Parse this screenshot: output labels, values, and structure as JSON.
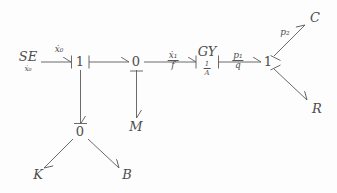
{
  "diagram": {
    "type": "bond-graph",
    "title": "",
    "background_color": "#fdfdfd",
    "line_color": "#5a5a5a",
    "text_color": "#4d4d4d",
    "nodes": [
      {
        "id": "se",
        "label": "SE",
        "sublabel": "ẋ₀",
        "kind": "source",
        "x": 28,
        "y": 62
      },
      {
        "id": "j1_left",
        "label": "1",
        "sublabel": "",
        "kind": "junction",
        "x": 80,
        "y": 61
      },
      {
        "id": "j0_mid",
        "label": "0",
        "sublabel": "",
        "kind": "junction",
        "x": 136,
        "y": 61
      },
      {
        "id": "gy",
        "label": "GY",
        "sublabel": "1/A",
        "kind": "gyrator",
        "x": 207,
        "y": 61
      },
      {
        "id": "j1_right",
        "label": "1",
        "sublabel": "",
        "kind": "junction",
        "x": 268,
        "y": 61
      },
      {
        "id": "j0_low",
        "label": "0",
        "sublabel": "",
        "kind": "junction",
        "x": 80,
        "y": 131
      },
      {
        "id": "m",
        "label": "M",
        "sublabel": "",
        "kind": "element",
        "x": 136,
        "y": 126
      },
      {
        "id": "k",
        "label": "K",
        "sublabel": "",
        "kind": "element",
        "x": 38,
        "y": 174
      },
      {
        "id": "b",
        "label": "B",
        "sublabel": "",
        "kind": "element",
        "x": 127,
        "y": 174
      },
      {
        "id": "c",
        "label": "C",
        "sublabel": "",
        "kind": "element",
        "x": 315,
        "y": 17
      },
      {
        "id": "r",
        "label": "R",
        "sublabel": "",
        "kind": "element",
        "x": 317,
        "y": 108
      }
    ],
    "bonds": [
      {
        "id": "bond_se_1",
        "from": "se",
        "to": "j1_left",
        "label_top": "ẋ₀",
        "label_bottom": "",
        "x": 59,
        "y": 50
      },
      {
        "id": "bond_1_0",
        "from": "j1_left",
        "to": "j0_mid",
        "label_top": "",
        "label_bottom": "",
        "x": 108,
        "y": 50
      },
      {
        "id": "bond_0_gy",
        "from": "j0_mid",
        "to": "gy",
        "label_top": "ẋ₁",
        "label_bottom": "f",
        "x": 173,
        "y": 61
      },
      {
        "id": "bond_gy_1",
        "from": "gy",
        "to": "j1_right",
        "label_top": "p₁",
        "label_bottom": "q",
        "x": 238,
        "y": 61
      },
      {
        "id": "bond_1_c",
        "from": "j1_right",
        "to": "c",
        "label_top": "p₂",
        "label_bottom": "",
        "x": 285,
        "y": 33
      },
      {
        "id": "bond_1_r",
        "from": "j1_right",
        "to": "r",
        "label_top": "",
        "label_bottom": "",
        "x": 300,
        "y": 85
      },
      {
        "id": "bond_1_0low",
        "from": "j1_left",
        "to": "j0_low",
        "label_top": "",
        "label_bottom": "",
        "x": 92,
        "y": 96
      },
      {
        "id": "bond_0_m",
        "from": "j0_mid",
        "to": "m",
        "label_top": "",
        "label_bottom": "",
        "x": 148,
        "y": 96
      },
      {
        "id": "bond_0_k",
        "from": "j0_low",
        "to": "k",
        "label_top": "",
        "label_bottom": "",
        "x": 55,
        "y": 155
      },
      {
        "id": "bond_0_b",
        "from": "j0_low",
        "to": "b",
        "label_top": "",
        "label_bottom": "",
        "x": 108,
        "y": 155
      }
    ],
    "gy_subscript": {
      "numerator": "1",
      "denominator": "A"
    }
  }
}
